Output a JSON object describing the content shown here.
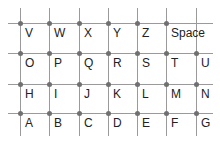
{
  "keyboard": {
    "rows": [
      [
        "V",
        "W",
        "X",
        "Y",
        "Z",
        "Space"
      ],
      [
        "O",
        "P",
        "Q",
        "R",
        "S",
        "T",
        "U"
      ],
      [
        "H",
        "I",
        "J",
        "K",
        "L",
        "M",
        "N"
      ],
      [
        "A",
        "B",
        "C",
        "D",
        "E",
        "F",
        "G"
      ]
    ],
    "colors": {
      "line": "#9a9a9a",
      "dot": "#707070",
      "text": "#222222"
    }
  }
}
